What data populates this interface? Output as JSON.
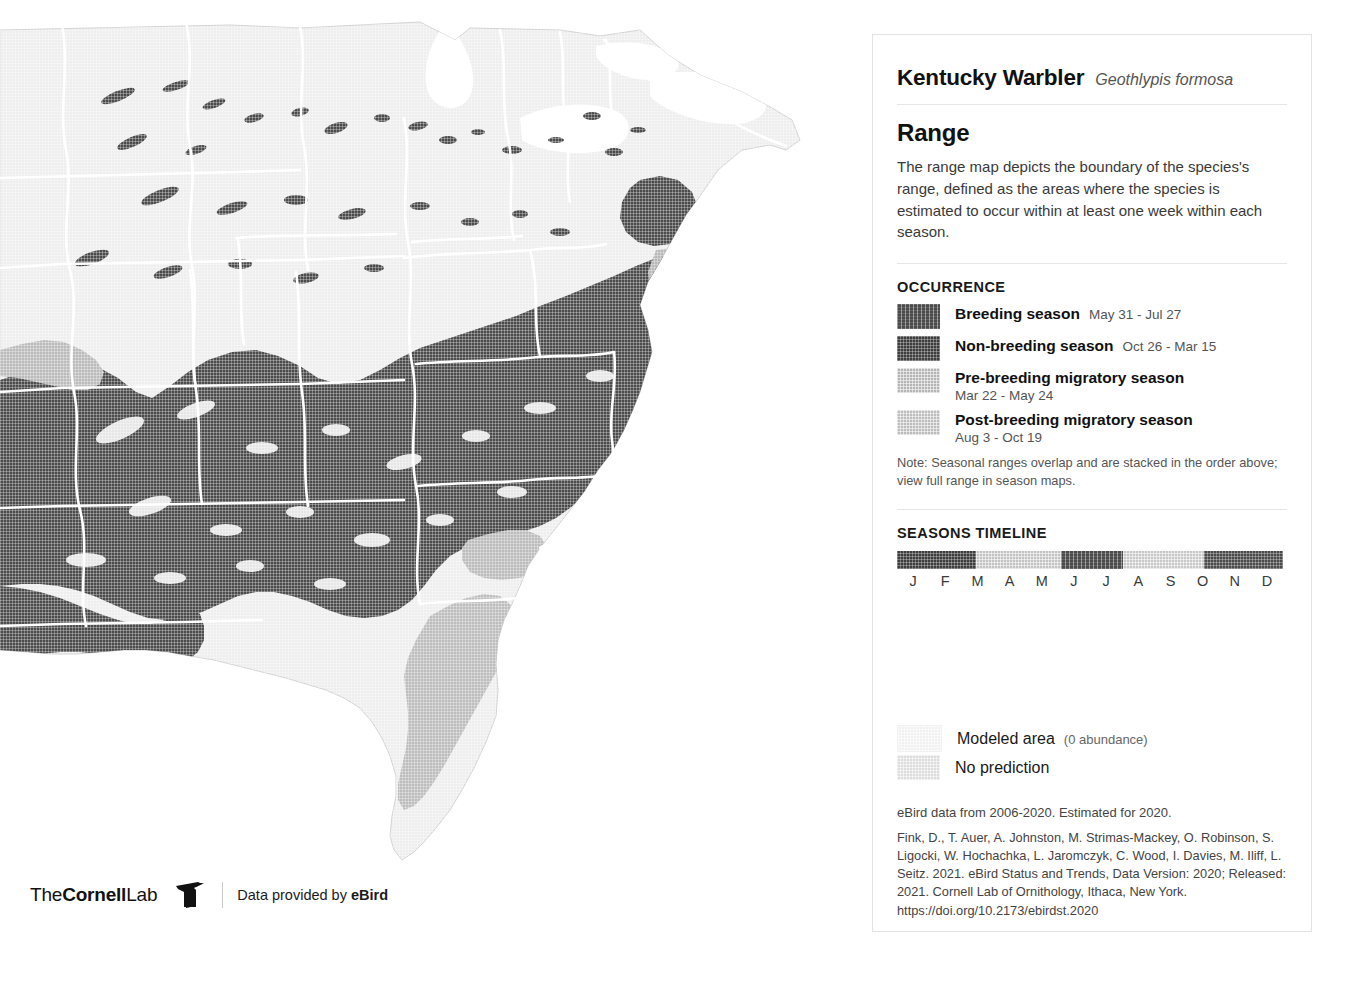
{
  "colors": {
    "breeding": "#4a4a4a",
    "non_breeding": "#3d3d3d",
    "pre_breeding_migration": "#b5b5b5",
    "post_breeding_migration": "#bdbdbd",
    "modeled_area": "#f1f1f1",
    "no_prediction": "#dcdcdc",
    "boundary_line": "#ffffff",
    "panel_border": "#e3e3e3",
    "background": "#ffffff"
  },
  "species": {
    "common_name": "Kentucky Warbler",
    "scientific_name": "Geothlypis formosa"
  },
  "range_section": {
    "title": "Range",
    "description": "The range map depicts the boundary of the species's range, defined as the areas where the species is estimated to occur within at least one week within each season."
  },
  "occurrence": {
    "heading": "OCCURRENCE",
    "items": [
      {
        "label": "Breeding season",
        "dates": "May 31 - Jul 27",
        "swatch": "breeding",
        "inline_dates": true
      },
      {
        "label": "Non-breeding season",
        "dates": "Oct 26 - Mar 15",
        "swatch": "non_breeding",
        "inline_dates": true
      },
      {
        "label": "Pre-breeding migratory season",
        "dates": "Mar 22 - May 24",
        "swatch": "pre_breeding_migration",
        "inline_dates": false
      },
      {
        "label": "Post-breeding migratory season",
        "dates": "Aug 3 - Oct 19",
        "swatch": "post_breeding_migration",
        "inline_dates": false
      }
    ],
    "note": "Note: Seasonal ranges overlap and are stacked in the order above; view full range in season maps."
  },
  "timeline": {
    "heading": "SEASONS TIMELINE",
    "months": [
      "J",
      "F",
      "M",
      "A",
      "M",
      "J",
      "J",
      "A",
      "S",
      "O",
      "N",
      "D"
    ],
    "segments": [
      {
        "season": "Non-breeding season",
        "color": "#3d3d3d",
        "texture": "plain",
        "start_pct": 0,
        "end_pct": 20.5
      },
      {
        "season": "Pre-breeding migratory season",
        "color": "#c3c3c3",
        "texture": "light",
        "start_pct": 20.5,
        "end_pct": 42.5
      },
      {
        "season": "Breeding season",
        "color": "#4a4a4a",
        "texture": "stripe",
        "start_pct": 42.5,
        "end_pct": 58.5
      },
      {
        "season": "Post-breeding migratory season",
        "color": "#c8c8c8",
        "texture": "light",
        "start_pct": 58.5,
        "end_pct": 79.5
      },
      {
        "season": "Non-breeding season",
        "color": "#4a4a4a",
        "texture": "plain",
        "start_pct": 79.5,
        "end_pct": 100
      }
    ]
  },
  "aux_legend": {
    "items": [
      {
        "label": "Modeled area",
        "sub": "(0 abundance)",
        "swatch": "modeled_area"
      },
      {
        "label": "No prediction",
        "sub": "",
        "swatch": "no_prediction"
      }
    ]
  },
  "citation": {
    "data_line": "eBird data from 2006-2020. Estimated for 2020.",
    "reference": "Fink, D., T. Auer, A. Johnston, M. Strimas-Mackey, O. Robinson, S. Ligocki, W. Hochachka, L. Jaromczyk, C. Wood, I. Davies, M. Iliff, L. Seitz. 2021. eBird Status and Trends, Data Version: 2020; Released: 2021. Cornell Lab of Ornithology, Ithaca, New York. https://doi.org/10.2173/ebirdst.2020"
  },
  "map_attribution": {
    "lab_the": "The",
    "lab_cornell": "Cornell",
    "lab_lab": "Lab",
    "provided_prefix": "Data provided by ",
    "provided_brand": "eBird",
    "bird_icon": "cornell-bird-icon"
  }
}
